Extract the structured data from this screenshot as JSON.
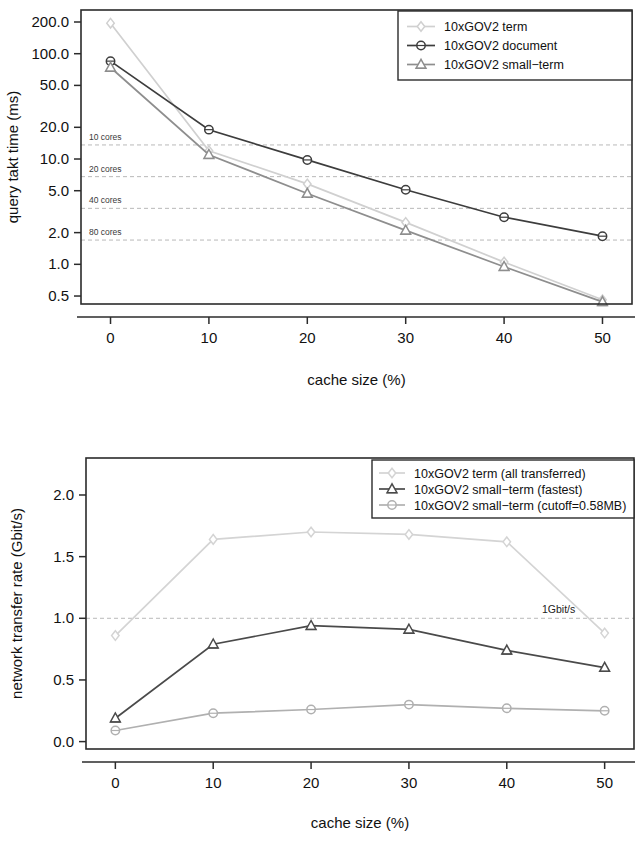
{
  "chart_data": [
    {
      "id": "query-takt-time",
      "type": "line",
      "title": "",
      "xlabel": "cache size (%)",
      "ylabel": "query takt time (ms)",
      "x": [
        0,
        10,
        20,
        30,
        40,
        50
      ],
      "xtick_labels": [
        "0",
        "10",
        "20",
        "30",
        "40",
        "50"
      ],
      "xlim": [
        -3,
        53
      ],
      "yscale": "log",
      "ytick_values": [
        200.0,
        100.0,
        50.0,
        20.0,
        10.0,
        5.0,
        2.0,
        1.0,
        0.5
      ],
      "ytick_labels": [
        "200.0",
        "100.0",
        "50.0",
        "20.0",
        "10.0",
        "5.0",
        "2.0",
        "1.0",
        "0.5"
      ],
      "ylim": [
        0.42,
        260
      ],
      "grid": false,
      "legend_position": "top-right",
      "series": [
        {
          "name": "10xGOV2 term",
          "marker": "diamond",
          "color": "#d0d0d0",
          "values": [
            195.0,
            12.0,
            5.8,
            2.5,
            1.05,
            0.46
          ]
        },
        {
          "name": "10xGOV2 document",
          "marker": "circle",
          "color": "#3d3d3d",
          "values": [
            85.0,
            19.0,
            9.8,
            5.1,
            2.8,
            1.85
          ]
        },
        {
          "name": "10xGOV2 small-term",
          "marker": "triangle",
          "color": "#8e8e8e",
          "values": [
            74.0,
            11.0,
            4.7,
            2.1,
            0.95,
            0.44
          ]
        }
      ],
      "reference_lines": [
        {
          "label": "10 cores",
          "value": 13.6
        },
        {
          "label": "20 cores",
          "value": 6.8
        },
        {
          "label": "40 cores",
          "value": 3.4
        },
        {
          "label": "80 cores",
          "value": 1.7
        }
      ]
    },
    {
      "id": "network-transfer-rate",
      "type": "line",
      "title": "",
      "xlabel": "cache size (%)",
      "ylabel": "network transfer rate (Gbit/s)",
      "x": [
        0,
        10,
        20,
        30,
        40,
        50
      ],
      "xtick_labels": [
        "0",
        "10",
        "20",
        "30",
        "40",
        "50"
      ],
      "xlim": [
        -3,
        53
      ],
      "yscale": "linear",
      "ytick_values": [
        0.0,
        0.5,
        1.0,
        1.5,
        2.0
      ],
      "ytick_labels": [
        "0.0",
        "0.5",
        "1.0",
        "1.5",
        "2.0"
      ],
      "ylim": [
        -0.06,
        2.3
      ],
      "grid": false,
      "legend_position": "top-right",
      "series": [
        {
          "name": "10xGOV2 term (all transferred)",
          "marker": "diamond",
          "color": "#d4d4d4",
          "values": [
            0.86,
            1.64,
            1.7,
            1.68,
            1.62,
            0.88
          ]
        },
        {
          "name": "10xGOV2 small-term (fastest)",
          "marker": "triangle",
          "color": "#4a4a4a",
          "values": [
            0.19,
            0.79,
            0.94,
            0.91,
            0.74,
            0.6
          ]
        },
        {
          "name": "10xGOV2 small-term (cutoff=0.58MB)",
          "marker": "circle",
          "color": "#b0b0b0",
          "values": [
            0.09,
            0.23,
            0.26,
            0.3,
            0.27,
            0.25
          ]
        }
      ],
      "reference_lines": [
        {
          "label": "1Gbit/s",
          "value": 1.0
        }
      ]
    }
  ],
  "colors": {
    "axis": "#2b2b2b",
    "refline": "#b9b9b9",
    "background": "#ffffff"
  }
}
